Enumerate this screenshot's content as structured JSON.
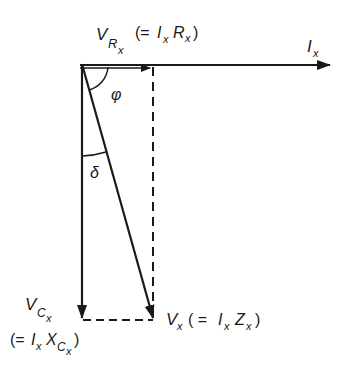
{
  "diagram": {
    "type": "phasor-diagram",
    "colors": {
      "ink": "#1a1a1a",
      "background": "#ffffff"
    },
    "labels": {
      "vr": {
        "main": "V",
        "sub": "R",
        "subsub": "x",
        "eq_open": "(=",
        "eq_i": "I",
        "eq_i_sub": "x",
        "eq_r": "R",
        "eq_r_sub": "x",
        "eq_close": ")"
      },
      "ix": {
        "main": "I",
        "sub": "x"
      },
      "phi": "φ",
      "delta": "δ",
      "vc": {
        "main": "V",
        "sub": "C",
        "subsub": "x",
        "eq_open": "(=",
        "eq_i": "I",
        "eq_i_sub": "x",
        "eq_x": "X",
        "eq_x_sub": "C",
        "eq_x_subsub": "x",
        "eq_close": ")"
      },
      "vx": {
        "main": "V",
        "sub": "x",
        "eq_open": "( =",
        "eq_i": "I",
        "eq_i_sub": "x",
        "eq_z": "Z",
        "eq_z_sub": "x",
        "eq_close": ")"
      }
    },
    "vectors": [
      {
        "name": "Ix",
        "from": [
          80,
          65
        ],
        "to": [
          330,
          65
        ],
        "style": "solid"
      },
      {
        "name": "VRx",
        "from": [
          80,
          66
        ],
        "to": [
          153,
          66
        ],
        "style": "solid"
      },
      {
        "name": "VCx",
        "from": [
          82,
          65
        ],
        "to": [
          82,
          320
        ],
        "style": "solid"
      },
      {
        "name": "Vx",
        "from": [
          82,
          65
        ],
        "to": [
          153,
          320
        ],
        "style": "solid"
      }
    ],
    "construction_lines": [
      {
        "from": [
          153,
          66
        ],
        "to": [
          153,
          320
        ],
        "style": "dashed"
      },
      {
        "from": [
          82,
          320
        ],
        "to": [
          153,
          320
        ],
        "style": "dashed"
      }
    ]
  }
}
